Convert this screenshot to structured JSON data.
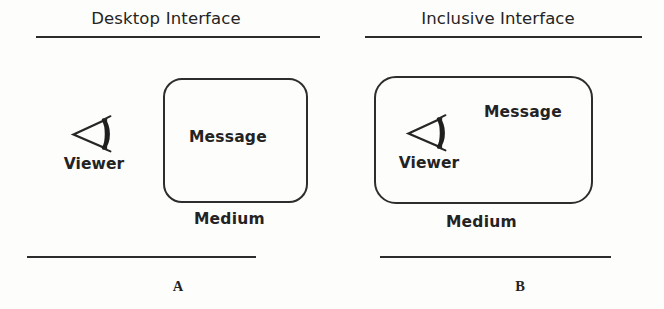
{
  "figure": {
    "background_color": "#fdfdfb",
    "ink_color": "#2b2b2b",
    "panels": [
      {
        "id": "a",
        "title": "Desktop Interface",
        "letter": "A",
        "message_label": "Message",
        "viewer_label": "Viewer",
        "viewer_icon": "viewer-eye-cone-icon",
        "medium_caption": "Medium",
        "viewer_placement": "outside-medium"
      },
      {
        "id": "b",
        "title": "Inclusive Interface",
        "letter": "B",
        "message_label": "Message",
        "viewer_label": "Viewer",
        "viewer_icon": "viewer-eye-cone-icon",
        "medium_caption": "Medium",
        "viewer_placement": "inside-medium"
      }
    ]
  }
}
